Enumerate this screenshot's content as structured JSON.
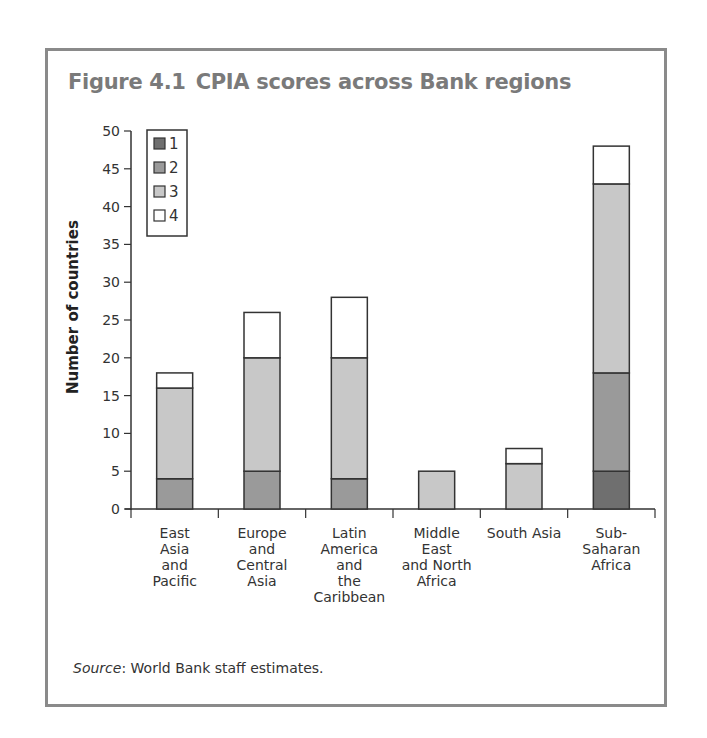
{
  "figure": {
    "number": "Figure 4.1",
    "title": "CPIA scores across Bank regions",
    "source_label": "Source",
    "source_text": ": World Bank staff estimates."
  },
  "colors": {
    "score1": "#6f6f6f",
    "score2": "#9a9a9a",
    "score3": "#c8c8c8",
    "score4": "#ffffff",
    "stroke": "#333333",
    "frame": "#8a8a8a",
    "title": "#7a7a7a"
  },
  "chart_data": {
    "type": "bar",
    "stacked": true,
    "title": "CPIA scores across Bank regions",
    "xlabel": "",
    "ylabel": "Number of countries",
    "ylim": [
      0,
      50
    ],
    "yticks": [
      0,
      5,
      10,
      15,
      20,
      25,
      30,
      35,
      40,
      45,
      50
    ],
    "grid": false,
    "legend_position": "upper-left-inside",
    "categories": [
      "East Asia and Pacific",
      "Europe and Central Asia",
      "Latin America and the Caribbean",
      "Middle East and North Africa",
      "South Asia",
      "Sub-Saharan Africa"
    ],
    "category_label_lines": [
      [
        "East",
        "Asia",
        "and",
        "Pacific"
      ],
      [
        "Europe",
        "and",
        "Central",
        "Asia"
      ],
      [
        "Latin",
        "America",
        "and",
        "the",
        "Caribbean"
      ],
      [
        "Middle",
        "East",
        "and North",
        "Africa"
      ],
      [
        "South Asia"
      ],
      [
        "Sub-",
        "Saharan",
        "Africa"
      ]
    ],
    "series": [
      {
        "name": "1",
        "values": [
          0,
          0,
          0,
          0,
          0,
          5
        ]
      },
      {
        "name": "2",
        "values": [
          4,
          5,
          4,
          0,
          0,
          13
        ]
      },
      {
        "name": "3",
        "values": [
          12,
          15,
          16,
          5,
          6,
          25
        ]
      },
      {
        "name": "4",
        "values": [
          2,
          6,
          8,
          0,
          2,
          5
        ]
      }
    ],
    "totals": [
      18,
      26,
      28,
      5,
      8,
      48
    ]
  }
}
